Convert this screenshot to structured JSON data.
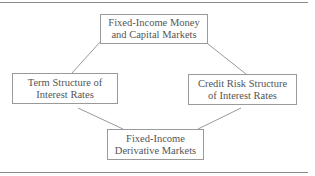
{
  "diagram": {
    "nodes": [
      {
        "id": "money_capital",
        "lines": [
          "Fixed-Income Money",
          "and Capital Markets"
        ]
      },
      {
        "id": "term_structure",
        "lines": [
          "Term Structure of",
          "Interest Rates"
        ]
      },
      {
        "id": "credit_risk",
        "lines": [
          "Credit Risk Structure",
          "of Interest Rates"
        ]
      },
      {
        "id": "derivatives",
        "lines": [
          "Fixed-Income",
          "Derivative Markets"
        ]
      }
    ],
    "edges": [
      {
        "from": "money_capital",
        "to": "term_structure"
      },
      {
        "from": "money_capital",
        "to": "credit_risk"
      },
      {
        "from": "term_structure",
        "to": "derivatives"
      },
      {
        "from": "credit_risk",
        "to": "derivatives"
      }
    ],
    "colors": {
      "border": "#9a9a9a",
      "line": "#9a9a9a",
      "text": "#555555",
      "rule": "#8a8a8a"
    }
  }
}
